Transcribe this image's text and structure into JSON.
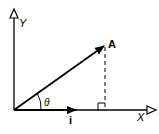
{
  "diagram": {
    "axes": {
      "x_label": "X",
      "y_label": "Y"
    },
    "vector": {
      "label": "A",
      "angle_label": "θ"
    },
    "unit_vector": {
      "label": "i"
    },
    "projection": {
      "style": "dashed",
      "right_angle_marker": true
    },
    "colors": {
      "stroke": "#000000",
      "background": "#ffffff"
    }
  }
}
